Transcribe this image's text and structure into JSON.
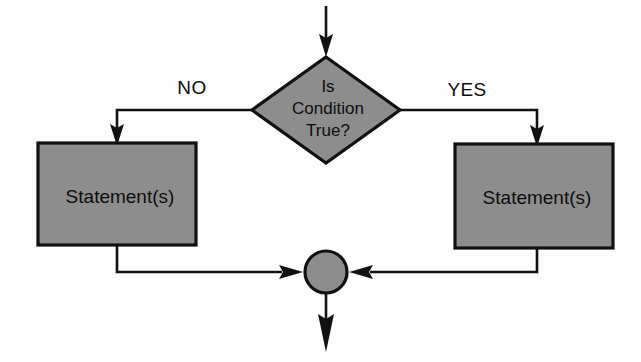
{
  "diagram": {
    "background_color": "#fdfdfd",
    "shape_fill_color": "#8d8d8d",
    "line_color": "#111111",
    "text_color": "#0d0d0d"
  },
  "decision": {
    "name": "condition-diamond",
    "line1": "Is",
    "line2": "Condition",
    "line3": "True?"
  },
  "branches": {
    "no_label": "NO",
    "yes_label": "YES"
  },
  "process_left": {
    "name": "statement-box-left",
    "label": "Statement(s)"
  },
  "process_right": {
    "name": "statement-box-right",
    "label": "Statement(s)"
  },
  "merge": {
    "name": "merge-connector",
    "label": ""
  },
  "flow": {
    "entry_arrow": "entry-arrow-down",
    "exit_arrow": "exit-arrow-down"
  }
}
